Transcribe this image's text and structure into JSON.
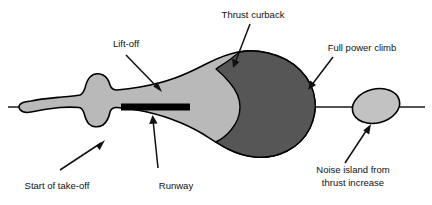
{
  "diagram": {
    "type": "aircraft-noise-contour-footprint",
    "colors": {
      "outer_contour_fill": "#b9b9b9",
      "inner_contour_fill": "#565656",
      "island_fill": "#c2c2c2",
      "outline": "#000000",
      "runway": "#000000",
      "axis": "#1a1a1a",
      "text": "#111111",
      "background": "#ffffff"
    },
    "labels": {
      "thrust_curback": "Thrust curback",
      "lift_off": "Lift-off",
      "full_power_climb": "Full power climb",
      "start_of_take_off": "Start of take-off",
      "runway": "Runway",
      "noise_island_line1": "Noise island from",
      "noise_island_line2": "thrust increase"
    },
    "regions": {
      "outer_label": "lower-level noise contour",
      "inner_label": "higher-level noise contour",
      "island_label": "detached noise island"
    }
  }
}
